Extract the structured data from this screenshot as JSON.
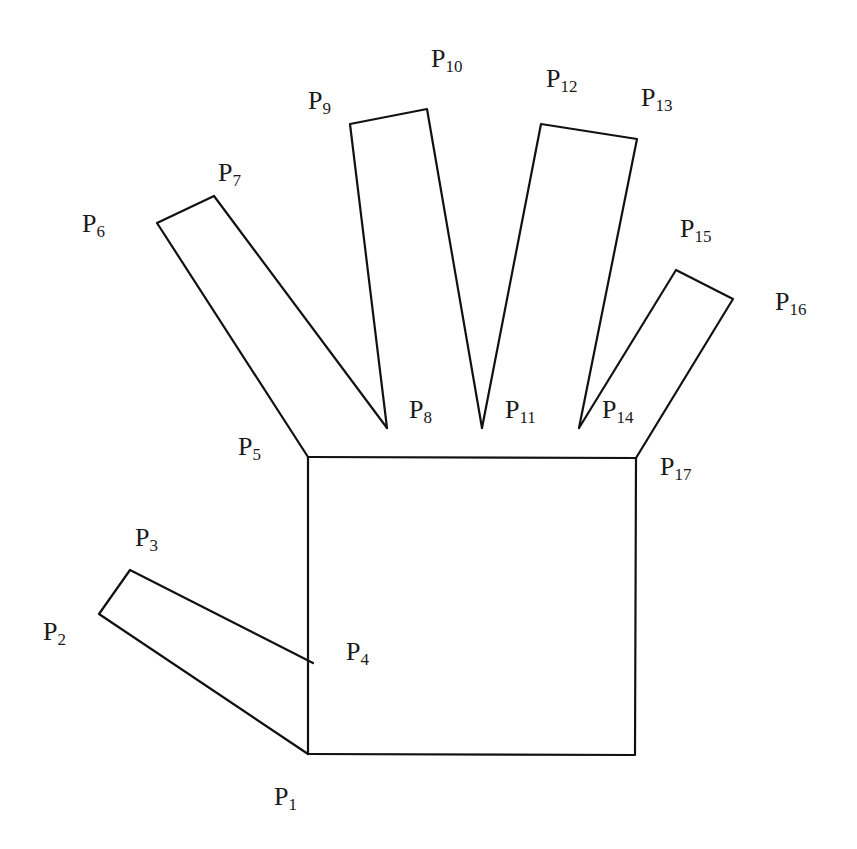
{
  "diagram": {
    "stroke_color": "#111111",
    "background": "#ffffff",
    "points": {
      "P1": [
        308,
        754
      ],
      "P2": [
        99,
        614
      ],
      "P3": [
        130,
        570
      ],
      "P4": [
        313,
        663
      ],
      "P5": [
        308,
        457
      ],
      "P6": [
        157,
        223
      ],
      "P7": [
        214,
        196
      ],
      "P8": [
        387,
        428
      ],
      "P9": [
        350,
        124
      ],
      "P10": [
        427,
        109
      ],
      "P11": [
        482,
        428
      ],
      "P12": [
        541,
        124
      ],
      "P13": [
        637,
        139
      ],
      "P14": [
        579,
        428
      ],
      "P15": [
        676,
        270
      ],
      "P16": [
        733,
        299
      ],
      "P17": [
        636,
        458
      ],
      "P18_corner": [
        635,
        755
      ]
    },
    "labels": [
      {
        "id": "P1",
        "base": "P",
        "sub": "1",
        "x": 274,
        "y": 805
      },
      {
        "id": "P2",
        "base": "P",
        "sub": "2",
        "x": 43,
        "y": 640
      },
      {
        "id": "P3",
        "base": "P",
        "sub": "3",
        "x": 135,
        "y": 546
      },
      {
        "id": "P4",
        "base": "P",
        "sub": "4",
        "x": 346,
        "y": 660
      },
      {
        "id": "P5",
        "base": "P",
        "sub": "5",
        "x": 238,
        "y": 455
      },
      {
        "id": "P6",
        "base": "P",
        "sub": "6",
        "x": 82,
        "y": 232
      },
      {
        "id": "P7",
        "base": "P",
        "sub": "7",
        "x": 218,
        "y": 181
      },
      {
        "id": "P8",
        "base": "P",
        "sub": "8",
        "x": 409,
        "y": 418
      },
      {
        "id": "P9",
        "base": "P",
        "sub": "9",
        "x": 308,
        "y": 109
      },
      {
        "id": "P10",
        "base": "P",
        "sub": "10",
        "x": 431,
        "y": 67
      },
      {
        "id": "P11",
        "base": "P",
        "sub": "11",
        "x": 505,
        "y": 418
      },
      {
        "id": "P12",
        "base": "P",
        "sub": "12",
        "x": 546,
        "y": 87
      },
      {
        "id": "P13",
        "base": "P",
        "sub": "13",
        "x": 641,
        "y": 106
      },
      {
        "id": "P14",
        "base": "P",
        "sub": "14",
        "x": 602,
        "y": 418
      },
      {
        "id": "P15",
        "base": "P",
        "sub": "15",
        "x": 680,
        "y": 237
      },
      {
        "id": "P16",
        "base": "P",
        "sub": "16",
        "x": 775,
        "y": 310
      },
      {
        "id": "P17",
        "base": "P",
        "sub": "17",
        "x": 660,
        "y": 475
      }
    ]
  }
}
